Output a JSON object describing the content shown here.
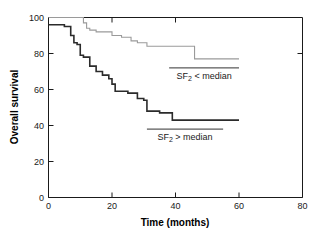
{
  "chart_data": {
    "type": "line",
    "subtype": "kaplan-meier-step",
    "title": "",
    "xlabel": "Time (months)",
    "ylabel": "Overall survival",
    "xlim": [
      0,
      80
    ],
    "ylim": [
      0,
      100
    ],
    "xticks": [
      0,
      20,
      40,
      60,
      80
    ],
    "yticks": [
      0,
      20,
      40,
      60,
      80,
      100
    ],
    "xticklabels": [
      "0",
      "20",
      "40",
      "60",
      "80"
    ],
    "yticklabels": [
      "0",
      "20",
      "40",
      "60",
      "80",
      "100"
    ],
    "grid": false,
    "legend_position": "inline-annotation",
    "series": [
      {
        "name": "SF2 < median",
        "label_text": "SF",
        "label_sub": "2",
        "label_rest": " < median",
        "color": "#9a9a9a",
        "linewidth": 1.1,
        "x": [
          0,
          11,
          11,
          12,
          12,
          13,
          13,
          15,
          15,
          20,
          20,
          23,
          23,
          26,
          26,
          28,
          28,
          31,
          31,
          46,
          46,
          60
        ],
        "y": [
          100,
          100,
          97,
          97,
          94,
          94,
          93,
          93,
          92,
          92,
          90,
          90,
          89,
          89,
          87,
          87,
          86,
          86,
          84,
          84,
          77,
          77
        ]
      },
      {
        "name": "SF2 > median",
        "label_text": "SF",
        "label_sub": "2",
        "label_rest": " > median",
        "color": "#2b2b2b",
        "linewidth": 1.6,
        "x": [
          0,
          5,
          5,
          7,
          7,
          8,
          8,
          9,
          9,
          10,
          10,
          11,
          11,
          13,
          13,
          15,
          15,
          17,
          17,
          19,
          19,
          20,
          20,
          21,
          21,
          25,
          25,
          28,
          28,
          30,
          30,
          31,
          31,
          35,
          35,
          39,
          39,
          60
        ],
        "y": [
          96,
          96,
          95,
          95,
          90,
          90,
          86,
          86,
          85,
          85,
          79,
          79,
          78,
          78,
          73,
          73,
          70,
          70,
          68,
          68,
          66,
          66,
          63,
          63,
          59,
          59,
          58,
          58,
          55,
          55,
          54,
          54,
          48,
          48,
          47,
          47,
          43,
          43
        ]
      }
    ],
    "annotations": [
      {
        "id": "upper-annotation",
        "text": "SF2 < median",
        "rule_x": [
          38,
          60
        ],
        "rule_y": 72,
        "text_x": 49,
        "text_y": 66
      },
      {
        "id": "lower-annotation",
        "text": "SF2 > median",
        "rule_x": [
          31,
          55
        ],
        "rule_y": 38,
        "text_x": 43,
        "text_y": 32
      }
    ]
  }
}
